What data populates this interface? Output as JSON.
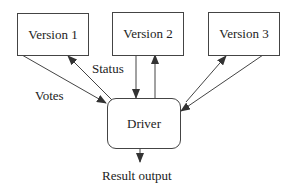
{
  "diagram": {
    "nodes": {
      "version1": "Version 1",
      "version2": "Version 2",
      "version3": "Version 3",
      "driver": "Driver"
    },
    "edge_labels": {
      "status": "Status",
      "votes": "Votes",
      "result": "Result output"
    },
    "edges": [
      {
        "from": "Version 1",
        "to": "Driver",
        "label": "Votes"
      },
      {
        "from": "Driver",
        "to": "Version 1",
        "label": "Status"
      },
      {
        "from": "Version 2",
        "to": "Driver"
      },
      {
        "from": "Driver",
        "to": "Version 2"
      },
      {
        "from": "Version 3",
        "to": "Driver"
      },
      {
        "from": "Driver",
        "to": "Version 3"
      },
      {
        "from": "Driver",
        "to": "output",
        "label": "Result output"
      }
    ],
    "colors": {
      "stroke": "#444444",
      "text": "#222222",
      "background": "#ffffff"
    }
  }
}
